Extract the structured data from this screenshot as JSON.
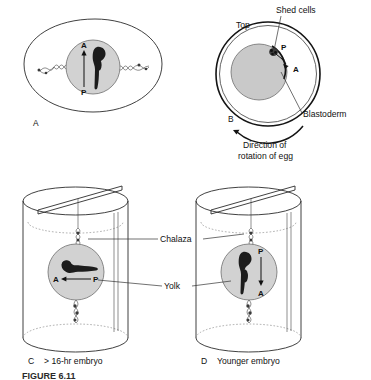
{
  "figure": {
    "domain_title": "Egg rotation and embryo orientation diagram",
    "caption_partial": "FIGURE 6.11",
    "colors": {
      "yolk_fill": "#d2d2d2",
      "yolk_fill_b": "#c9c9c9",
      "embryo_dark": "#1c1c1c",
      "outline": "#2b2b2b",
      "shell_heavy": "#141414",
      "background": "#ffffff"
    }
  },
  "panels": {
    "a": {
      "letter": "A",
      "anterior_label": "A",
      "posterior_label": "P",
      "arrow_direction": "up"
    },
    "b": {
      "letter": "B",
      "top_label": "Top",
      "shed_cells_label": "Shed cells",
      "blastoderm_label": "Blastoderm",
      "posterior_label": "P",
      "anterior_label": "A",
      "rotation_label_line1": "Direction of",
      "rotation_label_line2": "rotation of egg",
      "rotation_direction": "counterclockwise"
    },
    "c": {
      "letter": "C",
      "caption": "> 16-hr embryo",
      "anterior_label": "A",
      "posterior_label": "P",
      "arrow_direction": "left",
      "embryo_orientation": "horizontal"
    },
    "d": {
      "letter": "D",
      "caption": "Younger embryo",
      "posterior_label": "P",
      "anterior_label": "A",
      "arrow_direction": "down",
      "embryo_orientation": "vertical"
    }
  },
  "callouts": {
    "chalaza": "Chalaza",
    "yolk": "Yolk"
  }
}
